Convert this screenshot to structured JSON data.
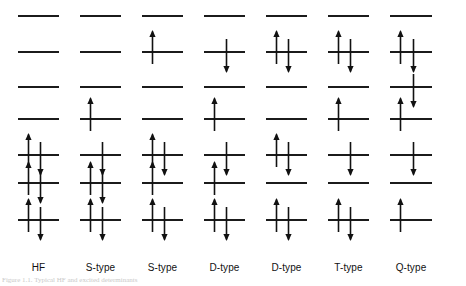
{
  "figure": {
    "caption": "Figure 1.1. Typical HF and excited determinants",
    "line_color": "#1b1b1b",
    "arrow_color": "#111111",
    "background": "#ffffff",
    "level_count": 7,
    "level_label": "energy-level",
    "spin_up_symbol": "↑",
    "spin_down_symbol": "↓"
  },
  "columns": [
    {
      "id": "col-hf",
      "label": "HF",
      "x": 18,
      "width": 41,
      "levels": [
        {
          "index": 1,
          "y": 15,
          "up": false,
          "down": false
        },
        {
          "index": 2,
          "y": 51,
          "up": false,
          "down": false
        },
        {
          "index": 3,
          "y": 86,
          "up": false,
          "down": false
        },
        {
          "index": 4,
          "y": 118,
          "up": false,
          "down": false
        },
        {
          "index": 5,
          "y": 154,
          "up": true,
          "down": true
        },
        {
          "index": 6,
          "y": 182,
          "up": true,
          "down": true
        },
        {
          "index": 7,
          "y": 219,
          "up": true,
          "down": true
        }
      ]
    },
    {
      "id": "col-s-type-1",
      "label": "S-type",
      "x": 80,
      "width": 41,
      "levels": [
        {
          "index": 1,
          "y": 15,
          "up": false,
          "down": false
        },
        {
          "index": 2,
          "y": 51,
          "up": false,
          "down": false
        },
        {
          "index": 3,
          "y": 86,
          "up": false,
          "down": false
        },
        {
          "index": 4,
          "y": 118,
          "up": true,
          "down": false
        },
        {
          "index": 5,
          "y": 154,
          "up": false,
          "down": true
        },
        {
          "index": 6,
          "y": 182,
          "up": true,
          "down": true
        },
        {
          "index": 7,
          "y": 219,
          "up": true,
          "down": true
        }
      ]
    },
    {
      "id": "col-s-type-2",
      "label": "S-type",
      "x": 142,
      "width": 41,
      "levels": [
        {
          "index": 1,
          "y": 15,
          "up": false,
          "down": false
        },
        {
          "index": 2,
          "y": 51,
          "up": true,
          "down": false
        },
        {
          "index": 3,
          "y": 86,
          "up": false,
          "down": false
        },
        {
          "index": 4,
          "y": 118,
          "up": false,
          "down": false
        },
        {
          "index": 5,
          "y": 154,
          "up": true,
          "down": true
        },
        {
          "index": 6,
          "y": 182,
          "up": true,
          "down": false
        },
        {
          "index": 7,
          "y": 219,
          "up": true,
          "down": true
        }
      ]
    },
    {
      "id": "col-d-type-1",
      "label": "D-type",
      "x": 204,
      "width": 41,
      "levels": [
        {
          "index": 1,
          "y": 15,
          "up": false,
          "down": false
        },
        {
          "index": 2,
          "y": 51,
          "up": false,
          "down": true
        },
        {
          "index": 3,
          "y": 86,
          "up": false,
          "down": false
        },
        {
          "index": 4,
          "y": 118,
          "up": true,
          "down": false
        },
        {
          "index": 5,
          "y": 154,
          "up": false,
          "down": true
        },
        {
          "index": 6,
          "y": 182,
          "up": true,
          "down": false
        },
        {
          "index": 7,
          "y": 219,
          "up": true,
          "down": true
        }
      ]
    },
    {
      "id": "col-d-type-2",
      "label": "D-type",
      "x": 266,
      "width": 41,
      "levels": [
        {
          "index": 1,
          "y": 15,
          "up": false,
          "down": false
        },
        {
          "index": 2,
          "y": 51,
          "up": true,
          "down": true
        },
        {
          "index": 3,
          "y": 86,
          "up": false,
          "down": false
        },
        {
          "index": 4,
          "y": 118,
          "up": false,
          "down": false
        },
        {
          "index": 5,
          "y": 154,
          "up": true,
          "down": true
        },
        {
          "index": 6,
          "y": 182,
          "up": false,
          "down": false
        },
        {
          "index": 7,
          "y": 219,
          "up": true,
          "down": true
        }
      ]
    },
    {
      "id": "col-t-type",
      "label": "T-type",
      "x": 328,
      "width": 41,
      "levels": [
        {
          "index": 1,
          "y": 15,
          "up": false,
          "down": false
        },
        {
          "index": 2,
          "y": 51,
          "up": true,
          "down": true
        },
        {
          "index": 3,
          "y": 86,
          "up": false,
          "down": false
        },
        {
          "index": 4,
          "y": 118,
          "up": true,
          "down": false
        },
        {
          "index": 5,
          "y": 154,
          "up": false,
          "down": true
        },
        {
          "index": 6,
          "y": 182,
          "up": false,
          "down": false
        },
        {
          "index": 7,
          "y": 219,
          "up": true,
          "down": true
        }
      ]
    },
    {
      "id": "col-q-type",
      "label": "Q-type",
      "x": 390,
      "width": 42,
      "levels": [
        {
          "index": 1,
          "y": 15,
          "up": false,
          "down": false
        },
        {
          "index": 2,
          "y": 51,
          "up": true,
          "down": true
        },
        {
          "index": 3,
          "y": 86,
          "up": false,
          "down": true
        },
        {
          "index": 4,
          "y": 118,
          "up": true,
          "down": false
        },
        {
          "index": 5,
          "y": 154,
          "up": false,
          "down": true
        },
        {
          "index": 6,
          "y": 182,
          "up": false,
          "down": false
        },
        {
          "index": 7,
          "y": 219,
          "up": true,
          "down": false
        }
      ]
    }
  ],
  "labels_y": 262
}
